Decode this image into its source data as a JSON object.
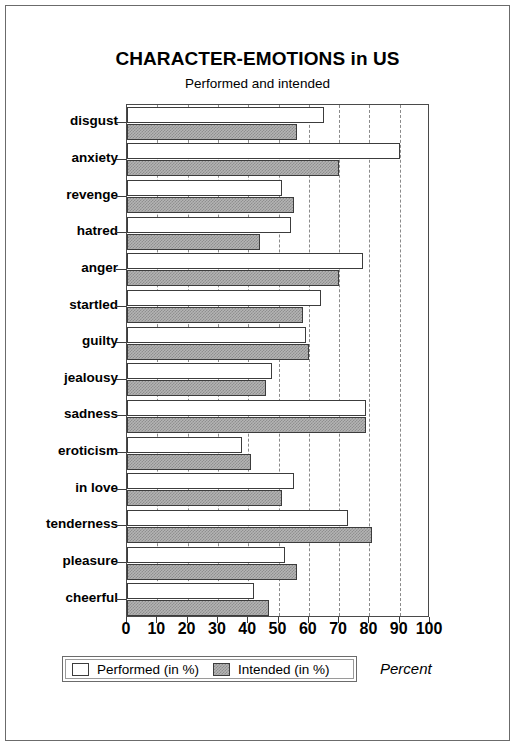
{
  "chart_data": {
    "type": "bar",
    "orientation": "horizontal",
    "title": "CHARACTER-EMOTIONS in US",
    "subtitle": "Performed and intended",
    "xlabel": "Percent",
    "ylabel": "",
    "xlim": [
      0,
      100
    ],
    "xticks": [
      0,
      10,
      20,
      30,
      40,
      50,
      60,
      70,
      80,
      90,
      100
    ],
    "xtick_labels": [
      "0",
      "10",
      "20",
      "30",
      "40",
      "50",
      "60",
      "70",
      "80",
      "90",
      "100"
    ],
    "grid": "vertical-dashed",
    "legend_position": "bottom",
    "categories": [
      "disgust",
      "anxiety",
      "revenge",
      "hatred",
      "anger",
      "startled",
      "guilty",
      "jealousy",
      "sadness",
      "eroticism",
      "in love",
      "tenderness",
      "pleasure",
      "cheerful"
    ],
    "series": [
      {
        "name": "Performed (in %)",
        "style": "hollow",
        "color": "#ffffff",
        "values": [
          65,
          90,
          51,
          54,
          78,
          64,
          59,
          48,
          79,
          38,
          55,
          73,
          52,
          42
        ]
      },
      {
        "name": "Intended (in %)",
        "style": "hatched",
        "color": "#b4b4b4",
        "values": [
          56,
          70,
          55,
          44,
          70,
          58,
          60,
          46,
          79,
          41,
          51,
          81,
          56,
          47
        ]
      }
    ]
  },
  "legend": {
    "items": [
      {
        "label": "Performed (in %)",
        "swatch": "hollow-swatch"
      },
      {
        "label": "Intended (in %)",
        "swatch": "hatched-swatch"
      }
    ]
  },
  "axis_caption": "Percent"
}
